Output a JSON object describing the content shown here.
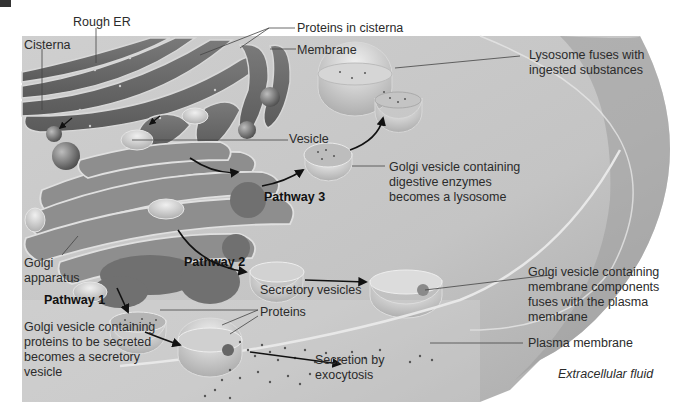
{
  "figure": {
    "colors": {
      "background": "#ffffff",
      "cytoplasm": "#c8c8c8",
      "organelle": "#8a8a8a",
      "text": "#2b2b2b",
      "arrow": "#111111"
    }
  },
  "labels": {
    "rough_er": "Rough ER",
    "cisterna": "Cisterna",
    "proteins_in_cisterna": "Proteins in cisterna",
    "membrane": "Membrane",
    "vesicle": "Vesicle",
    "lysosome_fuses": [
      "Lysosome fuses with",
      "ingested substances"
    ],
    "pathway3_desc": [
      "Golgi vesicle containing",
      "digestive enzymes",
      "becomes a lysosome"
    ],
    "golgi_apparatus": [
      "Golgi",
      "apparatus"
    ],
    "membrane_components_desc": [
      "Golgi vesicle containing",
      "membrane components",
      "fuses with the plasma",
      "membrane"
    ],
    "secretory_vesicles": "Secretory vesicles",
    "proteins": "Proteins",
    "pathway1_desc": [
      "Golgi vesicle containing",
      "proteins to be secreted",
      "becomes a secretory",
      "vesicle"
    ],
    "secretion": [
      "Secretion by",
      "exocytosis"
    ],
    "plasma_membrane": "Plasma membrane",
    "extracellular_fluid": "Extracellular fluid"
  },
  "pathways": [
    {
      "label": "Pathway 1"
    },
    {
      "label": "Pathway 2"
    },
    {
      "label": "Pathway 3"
    }
  ]
}
